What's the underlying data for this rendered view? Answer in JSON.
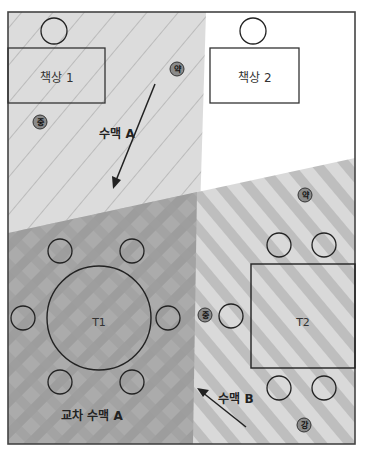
{
  "colors": {
    "frame": "#444444",
    "zone_a_fill": "#dcdcdc",
    "zone_a_hatch": "#9a9a9a",
    "zone_b_fill": "#d6d6d6",
    "zone_b_stripe": "#bdbdbd",
    "overlap_fill": "#a8a8a8",
    "badge_fill": "#8a8a8a"
  },
  "desks": [
    {
      "id": "desk-1",
      "label": "책상 1"
    },
    {
      "id": "desk-2",
      "label": "책상 2"
    }
  ],
  "tables": [
    {
      "id": "T1",
      "label": "T1",
      "shape": "circle",
      "seats": 6
    },
    {
      "id": "T2",
      "label": "T2",
      "shape": "rectangle",
      "seats": 5
    }
  ],
  "zones": {
    "a": {
      "label": "수맥 A"
    },
    "b": {
      "label": "수맥 B"
    },
    "overlap": {
      "label": "교차 수맥 A"
    }
  },
  "intensity_badges": [
    {
      "label": "약",
      "meaning": "weak",
      "near": "zone A top"
    },
    {
      "label": "중",
      "meaning": "medium",
      "near": "desk 1"
    },
    {
      "label": "약",
      "meaning": "weak",
      "near": "zone B top"
    },
    {
      "label": "중",
      "meaning": "medium",
      "near": "T2 left seat"
    },
    {
      "label": "강",
      "meaning": "strong",
      "near": "T2 bottom"
    }
  ]
}
